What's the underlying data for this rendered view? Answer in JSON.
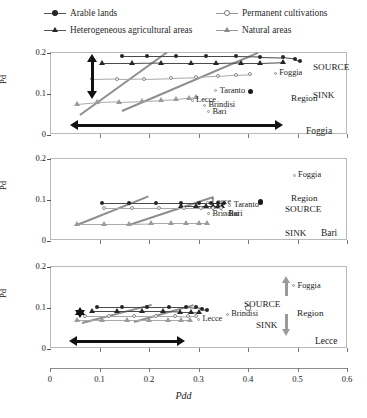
{
  "legend": {
    "items": [
      {
        "label": "Arable lands",
        "marker": "filled-circle-icon",
        "color": "#262626"
      },
      {
        "label": "Heterogeneous agricultural areas",
        "marker": "filled-triangle-icon",
        "color": "#262626"
      },
      {
        "label": "Permanent cultivations",
        "marker": "open-circle-icon",
        "color": "#8a8a8a"
      },
      {
        "label": "Natural areas",
        "marker": "open-triangle-icon",
        "color": "#8a8a8a"
      }
    ]
  },
  "axes": {
    "x_title": "Pdd",
    "x_ticks": [
      "0",
      "0.1",
      "0.2",
      "0.3",
      "0.4",
      "0.5",
      "0.6"
    ],
    "x_min": 0,
    "x_max": 0.6,
    "y_title": "Pd",
    "y_ticks": [
      "0",
      "0.1",
      "0.2"
    ],
    "y_min": 0,
    "y_max": 0.2
  },
  "annotations": {
    "source": "SOURCE",
    "sink": "SINK",
    "region": "Region"
  },
  "chart_data": {
    "type": "scatter",
    "title": "",
    "xlabel": "Pdd",
    "ylabel": "Pd",
    "xlim": [
      0,
      0.6
    ],
    "ylim": [
      0,
      0.2
    ],
    "grid": false,
    "legend_position": "top",
    "panels": [
      {
        "name": "Foggia",
        "panel_label": "Foggia",
        "series": [
          {
            "name": "Arable lands",
            "marker": "filled-circle",
            "x": [
              0.145,
              0.195,
              0.255,
              0.315,
              0.375,
              0.425,
              0.47,
              0.495,
              0.505
            ],
            "y": [
              0.19,
              0.19,
              0.19,
              0.19,
              0.19,
              0.189,
              0.188,
              0.184,
              0.179
            ]
          },
          {
            "name": "Heterogeneous agricultural areas",
            "marker": "filled-triangle",
            "x": [
              0.105,
              0.165,
              0.225,
              0.285,
              0.335,
              0.385,
              0.425,
              0.47
            ],
            "y": [
              0.172,
              0.172,
              0.173,
              0.173,
              0.173,
              0.174,
              0.174,
              0.176
            ]
          },
          {
            "name": "Permanent cultivations",
            "marker": "open-circle",
            "x": [
              0.085,
              0.135,
              0.19,
              0.245,
              0.295,
              0.34,
              0.375,
              0.405
            ],
            "y": [
              0.133,
              0.134,
              0.135,
              0.137,
              0.139,
              0.142,
              0.145,
              0.147
            ]
          },
          {
            "name": "Natural areas",
            "marker": "open-triangle",
            "x": [
              0.055,
              0.095,
              0.14,
              0.185,
              0.225,
              0.255,
              0.28,
              0.295
            ],
            "y": [
              0.073,
              0.077,
              0.079,
              0.081,
              0.083,
              0.085,
              0.088,
              0.09
            ]
          }
        ],
        "trend_lines": [
          {
            "x1": 0.06,
            "y1": 0.048,
            "x2": 0.235,
            "y2": 0.2
          },
          {
            "x1": 0.145,
            "y1": 0.058,
            "x2": 0.42,
            "y2": 0.2
          }
        ],
        "city_points": [
          {
            "label": "Taranto",
            "x": 0.335,
            "y": 0.105,
            "marker": "small-open"
          },
          {
            "label": "Lecce",
            "x": 0.287,
            "y": 0.082,
            "marker": "small-open"
          },
          {
            "label": "Brindisi",
            "x": 0.312,
            "y": 0.07,
            "marker": "small-open"
          },
          {
            "label": "Bari",
            "x": 0.32,
            "y": 0.054,
            "marker": "small-open"
          },
          {
            "label": "Foggia",
            "x": 0.455,
            "y": 0.148,
            "marker": "open-circle"
          }
        ],
        "region_marker": {
          "x": 0.405,
          "y": 0.104,
          "style": "filled"
        },
        "arrows": {
          "vertical_double": {
            "y_top": 0.196,
            "y_bottom": 0.085,
            "x": 0.085
          },
          "horizontal_double": {
            "x_left": 0.04,
            "x_right": 0.47,
            "y": 0.022
          },
          "source_arrow": "up",
          "sink_arrow": "down"
        }
      },
      {
        "name": "Bari",
        "panel_label": "Bari",
        "series": [
          {
            "name": "Arable lands",
            "marker": "filled-circle",
            "x": [
              0.105,
              0.16,
              0.215,
              0.265,
              0.3,
              0.325,
              0.34,
              0.352
            ],
            "y": [
              0.091,
              0.091,
              0.091,
              0.091,
              0.091,
              0.091,
              0.091,
              0.09
            ]
          },
          {
            "name": "Heterogeneous agricultural areas",
            "marker": "filled-triangle",
            "x": [
              0.265,
              0.295,
              0.315,
              0.33,
              0.34,
              0.348
            ],
            "y": [
              0.084,
              0.084,
              0.084,
              0.084,
              0.084,
              0.084
            ]
          },
          {
            "name": "Permanent cultivations",
            "marker": "open-circle",
            "x": [
              0.11,
              0.165,
              0.22,
              0.27,
              0.305,
              0.33,
              0.345
            ],
            "y": [
              0.077,
              0.077,
              0.077,
              0.077,
              0.077,
              0.077,
              0.077
            ]
          },
          {
            "name": "Natural areas",
            "marker": "open-triangle",
            "x": [
              0.055,
              0.11,
              0.16,
              0.205,
              0.245,
              0.275,
              0.3,
              0.318
            ],
            "y": [
              0.04,
              0.04,
              0.04,
              0.041,
              0.041,
              0.041,
              0.041,
              0.041
            ]
          }
        ],
        "trend_lines": [
          {
            "x1": 0.055,
            "y1": 0.038,
            "x2": 0.2,
            "y2": 0.108
          },
          {
            "x1": 0.16,
            "y1": 0.039,
            "x2": 0.33,
            "y2": 0.107
          }
        ],
        "city_points": [
          {
            "label": "Lecce",
            "x": 0.318,
            "y": 0.092,
            "marker": "small-open"
          },
          {
            "label": "Taranto",
            "x": 0.363,
            "y": 0.085,
            "marker": "small-open"
          },
          {
            "label": "Brindisi",
            "x": 0.32,
            "y": 0.064,
            "marker": "small-open"
          },
          {
            "label": "Bari",
            "x": 0.352,
            "y": 0.064,
            "marker": "small-open"
          },
          {
            "label": "Foggia",
            "x": 0.493,
            "y": 0.158,
            "marker": "small-open"
          }
        ],
        "region_marker": {
          "x": 0.425,
          "y": 0.093,
          "style": "filled"
        },
        "arrows": {
          "source_arrow": "up",
          "sink_arrow": "down"
        }
      },
      {
        "name": "Lecce",
        "panel_label": "Lecce",
        "series": [
          {
            "name": "Arable lands",
            "marker": "filled-circle",
            "x": [
              0.095,
              0.145,
              0.195,
              0.24,
              0.275,
              0.295,
              0.308,
              0.318
            ],
            "y": [
              0.101,
              0.101,
              0.101,
              0.101,
              0.101,
              0.099,
              0.096,
              0.093
            ]
          },
          {
            "name": "Heterogeneous agricultural areas",
            "marker": "filled-triangle",
            "x": [
              0.085,
              0.135,
              0.185,
              0.228,
              0.262,
              0.285,
              0.3
            ],
            "y": [
              0.09,
              0.09,
              0.09,
              0.09,
              0.089,
              0.089,
              0.088
            ]
          },
          {
            "name": "Permanent cultivations",
            "marker": "open-circle",
            "x": [
              0.07,
              0.12,
              0.17,
              0.215,
              0.252,
              0.278,
              0.295
            ],
            "y": [
              0.079,
              0.079,
              0.079,
              0.079,
              0.079,
              0.078,
              0.078
            ]
          },
          {
            "name": "Natural areas",
            "marker": "open-triangle",
            "x": [
              0.055,
              0.105,
              0.155,
              0.2,
              0.238,
              0.265,
              0.283
            ],
            "y": [
              0.068,
              0.068,
              0.068,
              0.068,
              0.068,
              0.068,
              0.068
            ]
          }
        ],
        "trend_lines": [
          {
            "x1": 0.065,
            "y1": 0.064,
            "x2": 0.205,
            "y2": 0.108
          },
          {
            "x1": 0.17,
            "y1": 0.066,
            "x2": 0.29,
            "y2": 0.107
          }
        ],
        "city_points": [
          {
            "label": "Lecce",
            "x": 0.3,
            "y": 0.07,
            "marker": "small-open"
          },
          {
            "label": "Brindisi",
            "x": 0.358,
            "y": 0.082,
            "marker": "small-open"
          },
          {
            "label": "Foggia",
            "x": 0.492,
            "y": 0.152,
            "marker": "small-open"
          }
        ],
        "region_marker": {
          "x": 0.4,
          "y": 0.098,
          "style": "open"
        },
        "arrows": {
          "vertical_double": {
            "y_top": 0.1,
            "y_bottom": 0.073,
            "x": 0.06
          },
          "horizontal_double": {
            "x_left": 0.038,
            "x_right": 0.272,
            "y": 0.018
          },
          "source_arrow": "up",
          "sink_arrow": "down"
        }
      }
    ]
  }
}
